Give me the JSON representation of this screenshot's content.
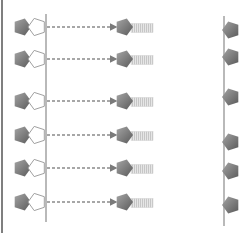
{
  "canvas": {
    "width": 242,
    "height": 233,
    "background": "#ffffff"
  },
  "colors": {
    "frame": "#555555",
    "membrane": "#a8a8a8",
    "dashed_arrow": "#8a8a8a",
    "pentagon_dark_start": "#9a9a9a",
    "pentagon_dark_end": "#5e5e5e",
    "pentagon_outline": "#a0a0a0",
    "tail_fill": "#e4e4e4",
    "tail_stripe": "#c4c4c4"
  },
  "frame": {
    "x": 2,
    "y1": 0,
    "y2": 233
  },
  "membranes": [
    {
      "name": "left-membrane",
      "x": 46,
      "y1": 14,
      "y2": 222
    },
    {
      "name": "right-membrane",
      "x": 224,
      "y1": 16,
      "y2": 226
    }
  ],
  "rows": [
    {
      "y": 27
    },
    {
      "y": 59
    },
    {
      "y": 101
    },
    {
      "y": 135
    },
    {
      "y": 168
    },
    {
      "y": 202
    }
  ],
  "right_markers": [
    {
      "y": 30
    },
    {
      "y": 57
    },
    {
      "y": 97
    },
    {
      "y": 142
    },
    {
      "y": 171
    },
    {
      "y": 205
    }
  ],
  "layout": {
    "dark_pentagon_cx": 22,
    "outline_pentagon_cx": 37,
    "arrow_start_x": 47,
    "arrow_end_x": 116,
    "moving_pentagon_cx": 124,
    "tail_x": 131,
    "tail_width": 22,
    "tail_height": 9,
    "pentagon_r": 9,
    "right_marker_cx": 231
  }
}
